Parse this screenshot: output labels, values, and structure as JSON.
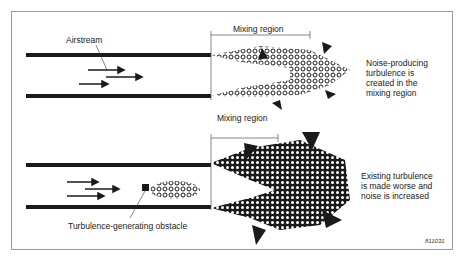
{
  "figure": {
    "reference_code": "811031",
    "top_panel": {
      "airstream_label": "Airstream",
      "mixing_region_label": "Mixing region",
      "description": "Noise-producing\nturbulence is\ncreated in the\nmixing region"
    },
    "bottom_panel": {
      "mixing_region_label": "Mixing region",
      "obstacle_label": "Turbulence-generating obstacle",
      "description": "Existing turbulence\nis made worse and\nnoise is increased"
    },
    "colors": {
      "ink": "#1a1a1a",
      "frame": "#9a9a9a",
      "background": "#ffffff"
    }
  }
}
